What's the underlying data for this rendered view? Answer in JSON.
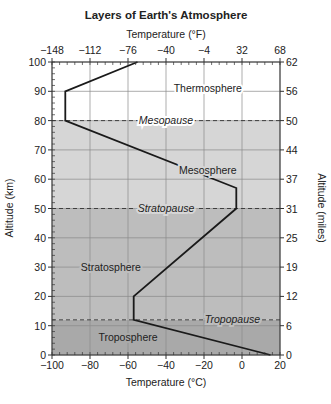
{
  "chart_data": {
    "type": "line",
    "title": "Layers of Earth's Atmosphere",
    "xlabel": "Temperature (°C)",
    "x2label": "Temperature (°F)",
    "ylabel": "Altitude (km)",
    "y2label": "Altitude (miles)",
    "xlim": [
      -100,
      20
    ],
    "ylim": [
      0,
      100
    ],
    "grid": true,
    "x_ticks": [
      -100,
      -80,
      -60,
      -40,
      -20,
      0,
      20
    ],
    "x_tick_labels": [
      "−100",
      "−80",
      "−60",
      "−40",
      "−20",
      "0",
      "20"
    ],
    "x2_ticks_celsius": [
      -100,
      -80,
      -60,
      -40,
      -20,
      0,
      20
    ],
    "x2_tick_labels": [
      "−148",
      "−112",
      "−76",
      "−40",
      "−4",
      "32",
      "68"
    ],
    "y_ticks": [
      0,
      10,
      20,
      30,
      40,
      50,
      60,
      70,
      80,
      90,
      100
    ],
    "y_tick_labels": [
      "0",
      "10",
      "20",
      "30",
      "40",
      "50",
      "60",
      "70",
      "80",
      "90",
      "100"
    ],
    "y2_ticks_km": [
      0,
      10,
      20,
      30,
      40,
      50,
      60,
      70,
      80,
      90,
      100
    ],
    "y2_tick_labels": [
      "0",
      "6",
      "12",
      "19",
      "25",
      "31",
      "37",
      "44",
      "50",
      "56",
      "62"
    ],
    "series": [
      {
        "name": "Temperature profile",
        "x": [
          15,
          -57,
          -57,
          -3,
          -3,
          -93,
          -93,
          -55
        ],
        "y": [
          0,
          12,
          20,
          50,
          57,
          80,
          90,
          100
        ]
      }
    ],
    "boundaries": [
      {
        "name": "Tropopause",
        "altitude": 12,
        "label_x": -5
      },
      {
        "name": "Stratopause",
        "altitude": 50,
        "label_x": -40
      },
      {
        "name": "Mesopause",
        "altitude": 80,
        "label_x": -40
      }
    ],
    "layers": [
      {
        "name": "Troposphere",
        "from": 0,
        "to": 12,
        "label_x": -60,
        "label_y": 6,
        "color": "#a9a9a9"
      },
      {
        "name": "Stratosphere",
        "from": 12,
        "to": 50,
        "label_x": -69,
        "label_y": 30,
        "color": "#bdbdbd"
      },
      {
        "name": "Mesosphere",
        "from": 50,
        "to": 80,
        "label_x": -18,
        "label_y": 63,
        "color": "#d6d6d6"
      },
      {
        "name": "Thermosphere",
        "from": 80,
        "to": 100,
        "label_x": -18,
        "label_y": 91,
        "color": "#ffffff"
      }
    ]
  }
}
